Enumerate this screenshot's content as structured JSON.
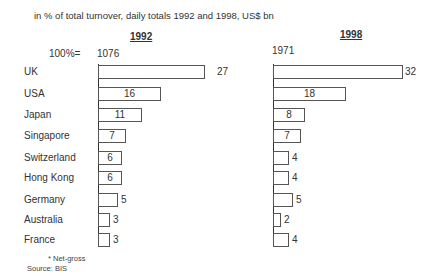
{
  "chart_data": {
    "type": "bar",
    "orientation": "horizontal",
    "title": "",
    "subtitle": "in % of total turnover,   daily totals 1992 and 1998, US$ bn",
    "categories": [
      "UK",
      "USA",
      "Japan",
      "Singapore",
      "Switzerland",
      "Hong Kong",
      "Germany",
      "Australia",
      "France"
    ],
    "series": [
      {
        "name": "1992",
        "total_label": "1076",
        "values": [
          27,
          16,
          11,
          7,
          6,
          6,
          5,
          3,
          3
        ]
      },
      {
        "name": "1998",
        "total_label": "1971",
        "values": [
          32,
          18,
          8,
          7,
          4,
          4,
          5,
          2,
          4
        ]
      }
    ],
    "total_prefix": "100%=",
    "xlabel": "",
    "ylabel": "",
    "grid": false,
    "legend": "none",
    "footnote": "* Net-gross",
    "source": "Source:  BIS"
  },
  "labels": {
    "subtitle": "in % of total turnover,   daily totals 1992 and 1998, US$ bn",
    "total_prefix": "100%=",
    "footnote": "* Net-gross",
    "source": "Source:  BIS",
    "panel_1992": "1992",
    "panel_1998": "1998",
    "total_1992": "1076",
    "total_1998": "1971",
    "rows": [
      {
        "name": "UK",
        "v92": "27",
        "v98": "32"
      },
      {
        "name": "USA",
        "v92": "16",
        "v98": "18"
      },
      {
        "name": "Japan",
        "v92": "11",
        "v98": "8"
      },
      {
        "name": "Singapore",
        "v92": "7",
        "v98": "7"
      },
      {
        "name": "Switzerland",
        "v92": "6",
        "v98": "4"
      },
      {
        "name": "Hong Kong",
        "v92": "6",
        "v98": "4"
      },
      {
        "name": "Germany",
        "v92": "5",
        "v98": "5"
      },
      {
        "name": "Australia",
        "v92": "3",
        "v98": "2"
      },
      {
        "name": "France",
        "v92": "3",
        "v98": "4"
      }
    ]
  }
}
